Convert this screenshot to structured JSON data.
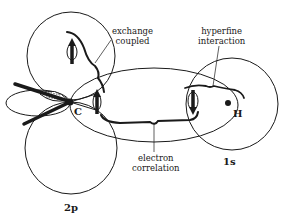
{
  "diagram": {
    "type": "orbital-interaction-diagram",
    "orbitals": {
      "carbon_p": "2p",
      "hydrogen_s": "1s"
    },
    "atoms": {
      "carbon": "C",
      "hydrogen": "H"
    },
    "annotations": {
      "exchange": {
        "line1": "exchange",
        "line2": "coupled"
      },
      "hyperfine": {
        "line1": "hyperfine",
        "line2": "interaction"
      },
      "correlation": {
        "line1": "electron",
        "line2": "correlation"
      }
    },
    "colors": {
      "ink": "#1a1a1a",
      "background": "#ffffff"
    }
  }
}
